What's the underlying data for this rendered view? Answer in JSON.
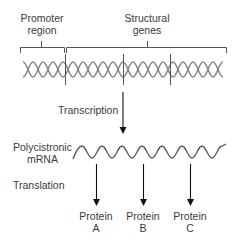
{
  "diagram": {
    "labels": {
      "promoter_line1": "Promoter",
      "promoter_line2": "region",
      "structural_line1": "Structural",
      "structural_line2": "genes",
      "transcription": "Transcription",
      "mrna_line1": "Polycistronic",
      "mrna_line2": "mRNA",
      "translation": "Translation"
    },
    "proteins": [
      {
        "name": "Protein",
        "letter": "A"
      },
      {
        "name": "Protein",
        "letter": "B"
      },
      {
        "name": "Protein",
        "letter": "C"
      }
    ],
    "colors": {
      "line": "#444444",
      "helix": "#888888",
      "arrow": "#111111",
      "text": "#3a3a3a"
    }
  }
}
